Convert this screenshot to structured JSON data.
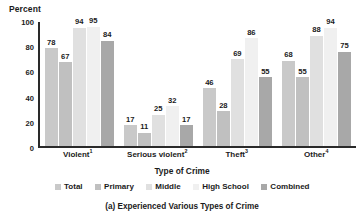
{
  "chart_data": {
    "type": "bar",
    "title": "",
    "caption": "(a) Experienced Various Types of Crime",
    "xlabel": "Type of Crime",
    "ylabel": "Percent",
    "ylim": [
      0,
      100
    ],
    "yticks": [
      100,
      80,
      60,
      40,
      20,
      0
    ],
    "grid": false,
    "legend_position": "bottom",
    "categories": [
      "Violent",
      "Serious violent",
      "Theft",
      "Other"
    ],
    "category_footnotes": [
      "1",
      "2",
      "3",
      "4"
    ],
    "series": [
      {
        "name": "Total",
        "color": "#c9c9c9",
        "values": [
          78,
          17,
          46,
          68
        ]
      },
      {
        "name": "Primary",
        "color": "#c0c0c0",
        "values": [
          67,
          11,
          28,
          55
        ]
      },
      {
        "name": "Middle",
        "color": "#e0e0e0",
        "values": [
          94,
          25,
          69,
          88
        ]
      },
      {
        "name": "High School",
        "color": "#f0f0f0",
        "values": [
          95,
          32,
          86,
          94
        ]
      },
      {
        "name": "Combined",
        "color": "#a8a8a8",
        "values": [
          84,
          17,
          55,
          75
        ]
      }
    ]
  },
  "colors": {
    "axis": "#2a2a2a",
    "text": "#1b1b1b",
    "background": "#ffffff"
  }
}
